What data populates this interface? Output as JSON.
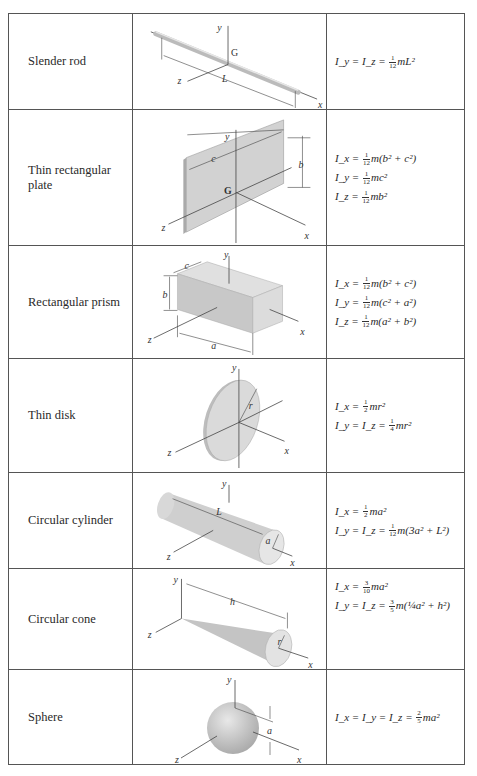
{
  "table": {
    "rows": [
      {
        "shape": "Slender rod",
        "labels": {
          "y": "y",
          "g": "G",
          "z": "z",
          "dim": "L",
          "x": "x"
        },
        "equations": [
          {
            "lhs": "I_y = I_z =",
            "frac": [
              "1",
              "12"
            ],
            "rhs": "mL²"
          }
        ]
      },
      {
        "shape": "Thin rectangular plate",
        "labels": {
          "y": "y",
          "c": "c",
          "b": "b",
          "g": "G",
          "z": "z",
          "x": "x"
        },
        "equations": [
          {
            "lhs": "I_x =",
            "frac": [
              "1",
              "12"
            ],
            "rhs": "m(b² + c²)"
          },
          {
            "lhs": "I_y =",
            "frac": [
              "1",
              "12"
            ],
            "rhs": "mc²"
          },
          {
            "lhs": "I_z =",
            "frac": [
              "1",
              "12"
            ],
            "rhs": "mb²"
          }
        ]
      },
      {
        "shape": "Rectangular prism",
        "labels": {
          "y": "y",
          "c": "c",
          "b": "b",
          "a": "a",
          "z": "z",
          "x": "x"
        },
        "equations": [
          {
            "lhs": "I_x =",
            "frac": [
              "1",
              "12"
            ],
            "rhs": "m(b² + c²)"
          },
          {
            "lhs": "I_y =",
            "frac": [
              "1",
              "12"
            ],
            "rhs": "m(c² + a²)"
          },
          {
            "lhs": "I_z =",
            "frac": [
              "1",
              "12"
            ],
            "rhs": "m(a² + b²)"
          }
        ]
      },
      {
        "shape": "Thin disk",
        "labels": {
          "y": "y",
          "r": "r",
          "z": "z",
          "x": "x"
        },
        "equations": [
          {
            "lhs": "I_x =",
            "frac": [
              "1",
              "2"
            ],
            "rhs": "mr²"
          },
          {
            "lhs": "I_y = I_z =",
            "frac": [
              "1",
              "4"
            ],
            "rhs": "mr²"
          }
        ]
      },
      {
        "shape": "Circular cylinder",
        "labels": {
          "y": "y",
          "L": "L",
          "a": "a",
          "z": "z",
          "x": "x"
        },
        "equations": [
          {
            "lhs": "I_x =",
            "frac": [
              "1",
              "2"
            ],
            "rhs": "ma²"
          },
          {
            "lhs": "I_y = I_z =",
            "frac": [
              "1",
              "12"
            ],
            "rhs": "m(3a² + L²)"
          }
        ]
      },
      {
        "shape": "Circular cone",
        "labels": {
          "y": "y",
          "h": "h",
          "r": "r",
          "z": "z",
          "x": "x"
        },
        "equations": [
          {
            "lhs": "I_x =",
            "frac": [
              "3",
              "10"
            ],
            "rhs": "ma²"
          },
          {
            "lhs": "I_y = I_z =",
            "frac": [
              "3",
              "5"
            ],
            "rhs": "m(¼a² + h²)"
          }
        ]
      },
      {
        "shape": "Sphere",
        "labels": {
          "y": "y",
          "a": "a",
          "z": "z",
          "x": "x"
        },
        "equations": [
          {
            "lhs": "I_x = I_y = I_z =",
            "frac": [
              "2",
              "5"
            ],
            "rhs": "ma²"
          }
        ]
      }
    ]
  }
}
